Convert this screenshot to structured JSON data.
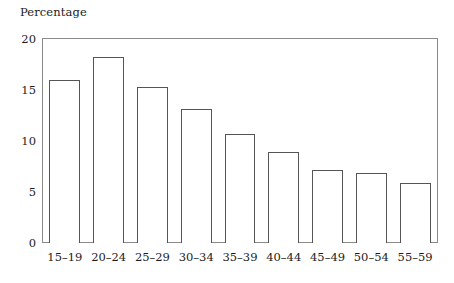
{
  "chart_data": {
    "type": "bar",
    "title": "",
    "xlabel": "",
    "ylabel": "Percentage",
    "categories": [
      "15–19",
      "20–24",
      "25–29",
      "30–34",
      "35–39",
      "40–44",
      "45–49",
      "50–54",
      "55–59"
    ],
    "values": [
      16.0,
      18.2,
      15.3,
      13.1,
      10.7,
      8.9,
      7.2,
      6.9,
      5.9
    ],
    "ylim": [
      0,
      20
    ],
    "yticks": [
      0,
      5,
      10,
      15,
      20
    ],
    "ytick_labels": [
      "0",
      "5",
      "10",
      "15",
      "20"
    ],
    "grid": false,
    "legend": null,
    "bar_fill_color": "#ffffff",
    "bar_edge_color": "#555555",
    "frame_color": "#8a8a8a",
    "text_color": "#1c1c1c"
  },
  "axis": {
    "y_title": "Percentage"
  }
}
